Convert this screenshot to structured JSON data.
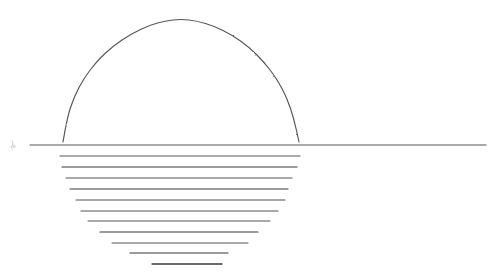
{
  "canvas": {
    "width": 501,
    "height": 272,
    "background_color": "#ffffff",
    "title": "Sunset over water line drawing"
  },
  "style": {
    "stroke_color": "#555555",
    "stroke_color_light": "#777777",
    "stroke_color_dark": "#3a3a3a",
    "stroke_width": 1.1,
    "texture": "pencil-grain"
  },
  "figure": {
    "name": "sun-over-horizon",
    "arc": {
      "name": "sun-dome-arc",
      "left_x": 63,
      "right_x": 299,
      "baseline_y": 142,
      "apex_x": 181,
      "apex_y": 19,
      "radius_x": 118,
      "radius_y": 123
    },
    "horizon": {
      "name": "horizon-line",
      "x1": 30,
      "x2": 486,
      "y": 145
    },
    "mark": {
      "name": "artist-mark",
      "x": 12,
      "y": 145,
      "label": ""
    }
  },
  "chart_data": {
    "type": "line",
    "title": "Sunset over water line drawing",
    "xlabel": "",
    "ylabel": "",
    "xlim": [
      0,
      501
    ],
    "ylim": [
      272,
      0
    ],
    "grid": false,
    "legend": "none",
    "series": [
      {
        "name": "sun-dome-arc",
        "shape": "semicircle",
        "points": [
          [
            63,
            142
          ],
          [
            67,
            118
          ],
          [
            74,
            97
          ],
          [
            84,
            78
          ],
          [
            97,
            61
          ],
          [
            113,
            46
          ],
          [
            131,
            34
          ],
          [
            150,
            25
          ],
          [
            165,
            21
          ],
          [
            181,
            19
          ],
          [
            197,
            21
          ],
          [
            214,
            26
          ],
          [
            232,
            35
          ],
          [
            249,
            47
          ],
          [
            264,
            62
          ],
          [
            277,
            79
          ],
          [
            287,
            98
          ],
          [
            294,
            119
          ],
          [
            299,
            142
          ]
        ]
      },
      {
        "name": "reflection-strokes",
        "shape": "horizontal-bars",
        "values": [
          {
            "index": 0,
            "y": 145,
            "x1": 30,
            "x2": 486,
            "length": 456,
            "weight": 1.1
          },
          {
            "index": 1,
            "y": 156,
            "x1": 60,
            "x2": 300,
            "length": 240,
            "weight": 1.1
          },
          {
            "index": 2,
            "y": 167,
            "x1": 62,
            "x2": 297,
            "length": 235,
            "weight": 1.2
          },
          {
            "index": 3,
            "y": 178,
            "x1": 66,
            "x2": 292,
            "length": 226,
            "weight": 1.0
          },
          {
            "index": 4,
            "y": 189,
            "x1": 70,
            "x2": 288,
            "length": 218,
            "weight": 1.2
          },
          {
            "index": 5,
            "y": 200,
            "x1": 76,
            "x2": 285,
            "length": 209,
            "weight": 1.1
          },
          {
            "index": 6,
            "y": 211,
            "x1": 81,
            "x2": 278,
            "length": 197,
            "weight": 1.1
          },
          {
            "index": 7,
            "y": 221,
            "x1": 88,
            "x2": 270,
            "length": 182,
            "weight": 1.0
          },
          {
            "index": 8,
            "y": 232,
            "x1": 100,
            "x2": 258,
            "length": 158,
            "weight": 1.2
          },
          {
            "index": 9,
            "y": 243,
            "x1": 112,
            "x2": 248,
            "length": 136,
            "weight": 1.0
          },
          {
            "index": 10,
            "y": 253,
            "x1": 130,
            "x2": 228,
            "length": 98,
            "weight": 1.2
          },
          {
            "index": 11,
            "y": 264,
            "x1": 152,
            "x2": 222,
            "length": 70,
            "weight": 1.4
          }
        ]
      }
    ]
  }
}
